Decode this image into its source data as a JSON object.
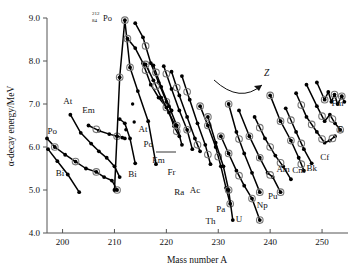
{
  "figure": {
    "name": "alpha-decay-energy-vs-mass-number",
    "background": "#ffffff",
    "ink": "#000000"
  },
  "annotations": {
    "peak_label_element": "Po",
    "peak_label_mass": "212",
    "peak_label_z": "84",
    "trend_arrow_label": "Z"
  },
  "chart_data": {
    "type": "line",
    "title": "",
    "xlabel": "Mass number A",
    "ylabel": "α-decay energy/MeV",
    "xlim": [
      197,
      255
    ],
    "ylim": [
      4.0,
      9.0
    ],
    "xticks": [
      200,
      210,
      220,
      230,
      240,
      250
    ],
    "yticks": [
      "4.0",
      "5.0",
      "6.0",
      "7.0",
      "8.0",
      "9.0"
    ],
    "grid": false,
    "legend": "inline element symbols next to each chain",
    "marker_note": "filled dots are data points; grey open rings mark even-even nuclides",
    "series": [
      {
        "name": "Bi",
        "label": "Bi",
        "label_pos": [
          199.5,
          5.32
        ],
        "x": [
          197.2,
          199.0,
          201.0,
          203.2
        ],
        "y": [
          5.95,
          5.67,
          5.36,
          4.95
        ],
        "rings": []
      },
      {
        "name": "Po-light",
        "label": "Po",
        "label_pos": [
          198.0,
          6.3
        ],
        "x": [
          197.0,
          198.5,
          200.5,
          202.5,
          204.5,
          206.5,
          208.0,
          209.5,
          210.5
        ],
        "y": [
          6.2,
          6.0,
          5.82,
          5.66,
          5.5,
          5.42,
          5.3,
          5.22,
          5.0
        ],
        "rings": [
          198.5,
          202.5,
          206.5,
          210.5
        ]
      },
      {
        "name": "At",
        "label": "At",
        "label_pos": [
          201.0,
          7.0
        ],
        "x": [
          201.5,
          203.5,
          205.5,
          207.0,
          208.5,
          210.0,
          211.0
        ],
        "y": [
          6.75,
          6.33,
          6.08,
          5.9,
          5.75,
          5.55,
          5.3
        ],
        "rings": []
      },
      {
        "name": "Em-light",
        "label": "Em",
        "label_pos": [
          205.0,
          6.78
        ],
        "x": [
          205.0,
          207.0,
          209.0,
          210.5,
          211.5,
          212.0
        ],
        "y": [
          6.5,
          6.38,
          6.3,
          6.25,
          6.22,
          6.2
        ],
        "rings": [
          206.5,
          210.5
        ]
      },
      {
        "name": "Po-212-peak",
        "label": "",
        "label_pos": [
          211.0,
          9.0
        ],
        "x": [
          210.0,
          211.0,
          212.0,
          213.0,
          214.5,
          216.5,
          218.0
        ],
        "y": [
          5.0,
          7.62,
          8.95,
          7.85,
          7.3,
          6.6,
          5.6
        ],
        "rings": [
          211.0,
          212.0,
          213.0
        ]
      },
      {
        "name": "Em-heavy",
        "label": "",
        "label_pos": [
          213.0,
          8.5
        ],
        "x": [
          212.5,
          214.0,
          215.5,
          217.0,
          218.5,
          220.0,
          221.5
        ],
        "y": [
          8.52,
          8.3,
          7.95,
          7.45,
          7.15,
          6.92,
          6.55
        ],
        "rings": [
          212.5,
          216.0,
          220.0
        ]
      },
      {
        "name": "Bi-heavy",
        "label": "Bi",
        "label_pos": [
          213.5,
          5.3
        ],
        "x": [
          211.0,
          212.0,
          213.0,
          214.0
        ],
        "y": [
          6.65,
          6.55,
          6.2,
          5.62
        ],
        "rings": []
      },
      {
        "name": "At-heavy",
        "label": "At",
        "label_pos": [
          215.5,
          6.35
        ],
        "x": [
          214.0,
          215.5,
          217.0,
          218.5,
          220.0,
          221.0
        ],
        "y": [
          8.88,
          8.55,
          7.95,
          7.5,
          7.05,
          6.85
        ],
        "rings": [
          216.0,
          220.0
        ]
      },
      {
        "name": "Po-heavy",
        "label": "Po",
        "label_pos": [
          216.5,
          6.0
        ],
        "x": [
          216.0,
          217.5,
          219.0,
          220.5,
          221.5,
          222.5
        ],
        "y": [
          7.92,
          7.55,
          7.15,
          6.8,
          6.48,
          6.25
        ],
        "rings": [
          216.0,
          218.0,
          222.0
        ]
      },
      {
        "name": "Em-222",
        "label": "Em",
        "label_pos": [
          218.5,
          5.62
        ],
        "x": [
          217.5,
          219.0,
          220.5,
          222.0,
          223.0
        ],
        "y": [
          7.9,
          7.4,
          6.95,
          6.5,
          6.05
        ],
        "rings": [
          218.0,
          222.0
        ]
      },
      {
        "name": "Fr",
        "label": "Fr",
        "label_pos": [
          221.0,
          5.35
        ],
        "x": [
          219.5,
          221.0,
          222.5,
          224.0,
          225.0
        ],
        "y": [
          7.88,
          7.35,
          6.85,
          6.4,
          5.95
        ],
        "rings": [
          220.0,
          224.0
        ]
      },
      {
        "name": "Ra",
        "label": "Ra",
        "label_pos": [
          222.5,
          4.88
        ],
        "x": [
          221.0,
          222.5,
          224.0,
          225.5,
          226.5
        ],
        "y": [
          7.75,
          7.2,
          6.7,
          6.2,
          5.9
        ],
        "rings": [
          222.0,
          226.0
        ]
      },
      {
        "name": "Ac",
        "label": "Ac",
        "label_pos": [
          225.5,
          4.92
        ],
        "x": [
          223.0,
          224.5,
          226.0,
          227.5,
          228.5
        ],
        "y": [
          7.65,
          7.1,
          6.55,
          6.05,
          5.6
        ],
        "rings": [
          224.0,
          228.0
        ]
      },
      {
        "name": "Th",
        "label": "Th",
        "label_pos": [
          228.5,
          4.22
        ],
        "x": [
          226.5,
          228.0,
          229.5,
          230.5,
          231.5,
          232.3
        ],
        "y": [
          6.95,
          6.5,
          6.0,
          5.55,
          5.05,
          4.68
        ],
        "rings": [
          226.5,
          228.0,
          230.0,
          232.3
        ]
      },
      {
        "name": "Pa",
        "label": "Pa",
        "label_pos": [
          230.5,
          4.48
        ],
        "x": [
          228.0,
          229.5,
          231.0,
          232.0,
          232.8
        ],
        "y": [
          6.7,
          6.1,
          5.55,
          5.0,
          4.3
        ],
        "rings": [
          228.0,
          232.0
        ]
      },
      {
        "name": "U",
        "label": "U",
        "label_pos": [
          234.0,
          4.25
        ],
        "x": [
          230.5,
          232.0,
          233.5,
          235.0,
          236.5,
          238.0
        ],
        "y": [
          6.25,
          5.85,
          5.45,
          5.1,
          4.8,
          4.3
        ],
        "rings": [
          230.5,
          232.0,
          234.0,
          236.5,
          238.0
        ]
      },
      {
        "name": "Np",
        "label": "Np",
        "label_pos": [
          238.5,
          4.58
        ],
        "x": [
          232.0,
          233.5,
          235.0,
          236.5,
          238.0
        ],
        "y": [
          7.0,
          6.35,
          5.85,
          5.4,
          4.95
        ],
        "rings": [
          232.0,
          234.0,
          238.0
        ]
      },
      {
        "name": "Pu",
        "label": "Pu",
        "label_pos": [
          240.5,
          4.8
        ],
        "x": [
          234.0,
          236.0,
          238.0,
          239.5,
          240.5,
          242.0
        ],
        "y": [
          6.85,
          6.25,
          5.75,
          5.4,
          5.3,
          4.95
        ],
        "rings": [
          236.0,
          238.0,
          240.0,
          242.0
        ]
      },
      {
        "name": "Am",
        "label": "Am",
        "label_pos": [
          242.5,
          5.42
        ],
        "x": [
          237.0,
          239.0,
          241.0,
          242.5,
          244.0
        ],
        "y": [
          6.7,
          6.2,
          5.8,
          5.55,
          5.25
        ],
        "rings": [
          238.0,
          240.0,
          242.0
        ]
      },
      {
        "name": "Cm",
        "label": "Cm",
        "label_pos": [
          245.5,
          5.4
        ],
        "x": [
          240.0,
          242.0,
          244.0,
          245.5,
          246.5
        ],
        "y": [
          7.2,
          6.6,
          6.15,
          5.75,
          5.45
        ],
        "rings": [
          240.0,
          242.0,
          244.0,
          246.0
        ]
      },
      {
        "name": "Bk",
        "label": "Bk",
        "label_pos": [
          248.0,
          5.45
        ],
        "x": [
          243.0,
          245.0,
          246.5,
          248.0
        ],
        "y": [
          6.9,
          6.35,
          5.95,
          5.62
        ],
        "rings": [
          244.0,
          246.0
        ]
      },
      {
        "name": "Cf",
        "label": "Cf",
        "label_pos": [
          250.5,
          5.7
        ],
        "x": [
          245.0,
          247.0,
          249.0,
          250.5,
          251.5,
          252.5
        ],
        "y": [
          7.25,
          6.7,
          6.35,
          6.1,
          6.15,
          6.25
        ],
        "rings": [
          246.0,
          248.0,
          250.0,
          252.0
        ]
      },
      {
        "name": "E",
        "label": "E",
        "label_pos": [
          253.5,
          6.35
        ],
        "x": [
          247.0,
          249.0,
          250.5,
          251.5,
          252.5,
          253.5
        ],
        "y": [
          7.45,
          6.95,
          6.6,
          6.75,
          6.55,
          6.4
        ],
        "rings": [
          250.0,
          252.0,
          253.5
        ]
      },
      {
        "name": "Fm",
        "label": "Fm",
        "label_pos": [
          253.0,
          6.95
        ],
        "x": [
          249.0,
          250.5,
          251.2,
          251.8,
          252.4,
          253.0,
          253.8,
          254.3
        ],
        "y": [
          7.5,
          7.1,
          7.28,
          7.05,
          7.22,
          7.0,
          7.18,
          7.05
        ],
        "rings": [
          250.5,
          252.4,
          253.8
        ]
      }
    ],
    "stray_points": [
      {
        "x": 213.5,
        "y": 7.0
      },
      {
        "x": 213.8,
        "y": 6.58
      },
      {
        "x": 212.2,
        "y": 6.4
      }
    ]
  }
}
